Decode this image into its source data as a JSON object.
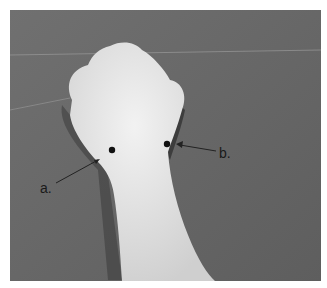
{
  "figure": {
    "background_color": "#6e6e6e",
    "skin_color": "#e6e6e6",
    "marker_color": "#111111",
    "labels": {
      "a": "a.",
      "b": "b."
    }
  }
}
